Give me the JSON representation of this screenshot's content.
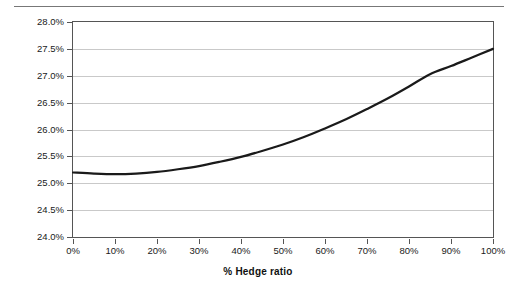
{
  "figure": {
    "top_rule_fragment": ""
  },
  "chart_data": {
    "type": "line",
    "title": "",
    "xlabel": "% Hedge ratio",
    "ylabel": "Vol %",
    "xlim": [
      0,
      100
    ],
    "ylim": [
      24.0,
      28.0
    ],
    "grid": true,
    "legend": false,
    "legend_position": "none",
    "line_color": "#1a1a1a",
    "grid_color": "#c9c9c9",
    "axis_color": "#555555",
    "background_color": "#ffffff",
    "x_tick_labels": [
      "0%",
      "10%",
      "20%",
      "30%",
      "40%",
      "50%",
      "60%",
      "70%",
      "80%",
      "90%",
      "100%"
    ],
    "x_ticks": [
      0,
      10,
      20,
      30,
      40,
      50,
      60,
      70,
      80,
      90,
      100
    ],
    "y_tick_labels": [
      "24.0%",
      "24.5%",
      "25.0%",
      "25.5%",
      "26.0%",
      "26.5%",
      "27.0%",
      "27.5%",
      "28.0%"
    ],
    "y_ticks": [
      24.0,
      24.5,
      25.0,
      25.5,
      26.0,
      26.5,
      27.0,
      27.5,
      28.0
    ],
    "series": [
      {
        "name": "Portfolio volatility",
        "x": [
          0,
          5,
          10,
          15,
          20,
          25,
          30,
          35,
          40,
          45,
          50,
          55,
          60,
          65,
          70,
          75,
          80,
          85,
          90,
          95,
          100
        ],
        "values": [
          25.2,
          25.18,
          25.17,
          25.18,
          25.21,
          25.26,
          25.32,
          25.4,
          25.49,
          25.6,
          25.72,
          25.86,
          26.02,
          26.19,
          26.38,
          26.58,
          26.8,
          27.03,
          27.18,
          27.34,
          27.5
        ]
      }
    ]
  }
}
